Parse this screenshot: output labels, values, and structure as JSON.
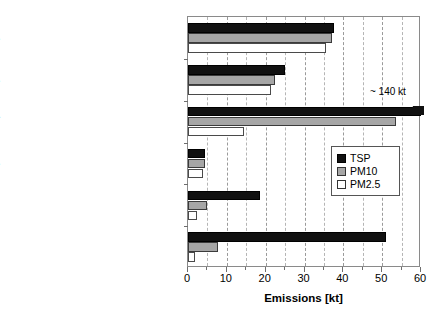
{
  "chart_data": {
    "type": "bar",
    "orientation": "horizontal",
    "title": "",
    "xlabel": "Emissions [kt]",
    "ylabel": "",
    "xlim": [
      0,
      60
    ],
    "xticks": [
      0,
      10,
      20,
      30,
      40,
      50,
      60
    ],
    "xtick_labels": [
      "0",
      "10",
      "20",
      "30",
      "40",
      "50",
      "60"
    ],
    "minor_tick_step": 5,
    "grid": "vertical-dashed",
    "legend_position": "center-right",
    "categories": [
      "Road transport - Diesel engines",
      "Nonroad - Engines",
      "Road transport - Road abrasion & suspension",
      "Road transport - Gasoline engines",
      "Nonroad - Abrasion & suspension",
      "Road transport - Tyre & brake lining abrasion"
    ],
    "series": [
      {
        "name": "TSP",
        "color": "#111111",
        "values": [
          37.5,
          25.0,
          140.0,
          4.5,
          18.5,
          51.0
        ]
      },
      {
        "name": "PM10",
        "color": "#a6a6a6",
        "values": [
          37.0,
          22.5,
          53.5,
          4.3,
          5.0,
          7.8
        ]
      },
      {
        "name": "PM2.5",
        "color": "#ffffff",
        "values": [
          35.5,
          21.5,
          14.5,
          3.8,
          2.3,
          1.8
        ]
      }
    ],
    "annotations": [
      {
        "text": "~ 140 kt",
        "refers_to_category": "Road transport - Road abrasion & suspension",
        "refers_to_series": "TSP",
        "note": "bar is axis-broken; true value exceeds axis maximum"
      }
    ]
  },
  "legend": {
    "items": [
      {
        "label": "TSP"
      },
      {
        "label": "PM10"
      },
      {
        "label": "PM2.5"
      }
    ]
  },
  "axis": {
    "x_title": "Emissions [kt]"
  }
}
